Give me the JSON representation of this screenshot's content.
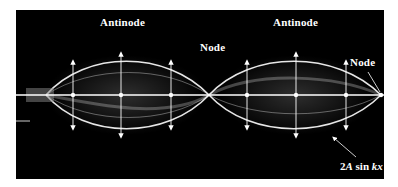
{
  "figure": {
    "labels": {
      "antinode_left": "Antinode",
      "antinode_right": "Antinode",
      "node_middle": "Node",
      "node_right": "Node"
    },
    "formula": {
      "prefix": "2",
      "A": "A",
      "middle": " sin ",
      "kx": "kx"
    },
    "colors": {
      "background": "#000000",
      "wave": "#ffffff",
      "page": "#ffffff"
    }
  }
}
